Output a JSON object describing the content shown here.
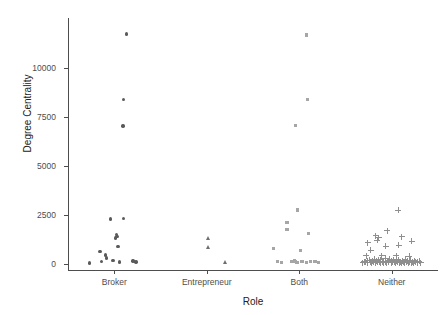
{
  "chart_data": {
    "type": "scatter",
    "title": "",
    "xlabel": "Role",
    "ylabel": "Degree Centrality",
    "categories": [
      "Broker",
      "Entrepreneur",
      "Both",
      "Neither"
    ],
    "ylim": [
      0,
      12500
    ],
    "yticks": [
      0,
      2500,
      5000,
      7500,
      10000
    ],
    "ytick_labels": [
      "0",
      "2500",
      "5000",
      "7500",
      "10000"
    ],
    "grid": false,
    "legend": "none",
    "series": [
      {
        "name": "Broker",
        "marker": "circle",
        "color": "#5a5a5a",
        "points": [
          {
            "jitter": -0.34,
            "y": 60
          },
          {
            "jitter": -0.2,
            "y": 640
          },
          {
            "jitter": -0.18,
            "y": 120
          },
          {
            "jitter": -0.12,
            "y": 460
          },
          {
            "jitter": -0.11,
            "y": 300
          },
          {
            "jitter": -0.05,
            "y": 2290
          },
          {
            "jitter": -0.02,
            "y": 180
          },
          {
            "jitter": 0.02,
            "y": 1320
          },
          {
            "jitter": 0.03,
            "y": 1520
          },
          {
            "jitter": 0.04,
            "y": 1420
          },
          {
            "jitter": 0.05,
            "y": 880
          },
          {
            "jitter": 0.07,
            "y": 110
          },
          {
            "jitter": 0.13,
            "y": 2330
          },
          {
            "jitter": 0.26,
            "y": 150
          },
          {
            "jitter": 0.3,
            "y": 110
          },
          {
            "jitter": 0.12,
            "y": 7050
          },
          {
            "jitter": 0.13,
            "y": 8400
          },
          {
            "jitter": 0.17,
            "y": 11730
          }
        ]
      },
      {
        "name": "Entrepreneur",
        "marker": "triangle",
        "color": "#6e6e6e",
        "points": [
          {
            "jitter": 0.02,
            "y": 1320
          },
          {
            "jitter": 0.02,
            "y": 860
          },
          {
            "jitter": 0.26,
            "y": 70
          }
        ]
      },
      {
        "name": "Both",
        "marker": "square",
        "color": "#a6a6a6",
        "points": [
          {
            "jitter": -0.36,
            "y": 800
          },
          {
            "jitter": -0.3,
            "y": 140
          },
          {
            "jitter": -0.24,
            "y": 60
          },
          {
            "jitter": -0.17,
            "y": 1740
          },
          {
            "jitter": -0.1,
            "y": 120
          },
          {
            "jitter": -0.07,
            "y": 180
          },
          {
            "jitter": -0.05,
            "y": 130
          },
          {
            "jitter": -0.03,
            "y": 90
          },
          {
            "jitter": 0.02,
            "y": 700
          },
          {
            "jitter": 0.04,
            "y": 120
          },
          {
            "jitter": 0.1,
            "y": 80
          },
          {
            "jitter": 0.16,
            "y": 130
          },
          {
            "jitter": 0.22,
            "y": 110
          },
          {
            "jitter": 0.27,
            "y": 80
          },
          {
            "jitter": -0.17,
            "y": 2100
          },
          {
            "jitter": -0.02,
            "y": 2750
          },
          {
            "jitter": 0.13,
            "y": 1560
          },
          {
            "jitter": -0.05,
            "y": 7080
          },
          {
            "jitter": 0.12,
            "y": 8400
          },
          {
            "jitter": 0.1,
            "y": 11680
          }
        ]
      },
      {
        "name": "Neither",
        "marker": "plus",
        "color": "#8f8f8f",
        "points": [
          {
            "jitter": -0.4,
            "y": 60
          },
          {
            "jitter": -0.38,
            "y": 120
          },
          {
            "jitter": -0.36,
            "y": 90
          },
          {
            "jitter": -0.34,
            "y": 160
          },
          {
            "jitter": -0.33,
            "y": 60
          },
          {
            "jitter": -0.31,
            "y": 200
          },
          {
            "jitter": -0.3,
            "y": 100
          },
          {
            "jitter": -0.28,
            "y": 70
          },
          {
            "jitter": -0.27,
            "y": 150
          },
          {
            "jitter": -0.25,
            "y": 90
          },
          {
            "jitter": -0.24,
            "y": 250
          },
          {
            "jitter": -0.23,
            "y": 60
          },
          {
            "jitter": -0.21,
            "y": 130
          },
          {
            "jitter": -0.2,
            "y": 80
          },
          {
            "jitter": -0.19,
            "y": 180
          },
          {
            "jitter": -0.17,
            "y": 100
          },
          {
            "jitter": -0.16,
            "y": 60
          },
          {
            "jitter": -0.15,
            "y": 220
          },
          {
            "jitter": -0.13,
            "y": 90
          },
          {
            "jitter": -0.12,
            "y": 140
          },
          {
            "jitter": -0.11,
            "y": 70
          },
          {
            "jitter": -0.09,
            "y": 300
          },
          {
            "jitter": -0.08,
            "y": 110
          },
          {
            "jitter": -0.07,
            "y": 60
          },
          {
            "jitter": -0.05,
            "y": 170
          },
          {
            "jitter": -0.04,
            "y": 90
          },
          {
            "jitter": -0.03,
            "y": 240
          },
          {
            "jitter": -0.01,
            "y": 60
          },
          {
            "jitter": 0.0,
            "y": 130
          },
          {
            "jitter": 0.01,
            "y": 80
          },
          {
            "jitter": 0.03,
            "y": 190
          },
          {
            "jitter": 0.04,
            "y": 100
          },
          {
            "jitter": 0.05,
            "y": 60
          },
          {
            "jitter": 0.07,
            "y": 150
          },
          {
            "jitter": 0.08,
            "y": 90
          },
          {
            "jitter": 0.09,
            "y": 210
          },
          {
            "jitter": 0.11,
            "y": 70
          },
          {
            "jitter": 0.12,
            "y": 120
          },
          {
            "jitter": 0.13,
            "y": 60
          },
          {
            "jitter": 0.15,
            "y": 160
          },
          {
            "jitter": 0.16,
            "y": 95
          },
          {
            "jitter": 0.18,
            "y": 60
          },
          {
            "jitter": 0.19,
            "y": 230
          },
          {
            "jitter": 0.2,
            "y": 85
          },
          {
            "jitter": 0.22,
            "y": 140
          },
          {
            "jitter": 0.23,
            "y": 65
          },
          {
            "jitter": 0.25,
            "y": 110
          },
          {
            "jitter": 0.26,
            "y": 180
          },
          {
            "jitter": 0.27,
            "y": 75
          },
          {
            "jitter": 0.29,
            "y": 120
          },
          {
            "jitter": 0.3,
            "y": 60
          },
          {
            "jitter": 0.32,
            "y": 155
          },
          {
            "jitter": 0.33,
            "y": 85
          },
          {
            "jitter": 0.35,
            "y": 100
          },
          {
            "jitter": 0.36,
            "y": 60
          },
          {
            "jitter": 0.38,
            "y": 130
          },
          {
            "jitter": 0.4,
            "y": 70
          },
          {
            "jitter": -0.35,
            "y": 430
          },
          {
            "jitter": -0.29,
            "y": 700
          },
          {
            "jitter": -0.14,
            "y": 420
          },
          {
            "jitter": 0.06,
            "y": 410
          },
          {
            "jitter": 0.24,
            "y": 390
          },
          {
            "jitter": -0.33,
            "y": 1080
          },
          {
            "jitter": -0.22,
            "y": 1450
          },
          {
            "jitter": -0.2,
            "y": 1200
          },
          {
            "jitter": -0.08,
            "y": 900
          },
          {
            "jitter": 0.1,
            "y": 960
          },
          {
            "jitter": -0.18,
            "y": 1330
          },
          {
            "jitter": 0.09,
            "y": 2750
          },
          {
            "jitter": 0.28,
            "y": 1150
          },
          {
            "jitter": 0.14,
            "y": 1400
          },
          {
            "jitter": -0.06,
            "y": 1700
          }
        ]
      }
    ]
  }
}
